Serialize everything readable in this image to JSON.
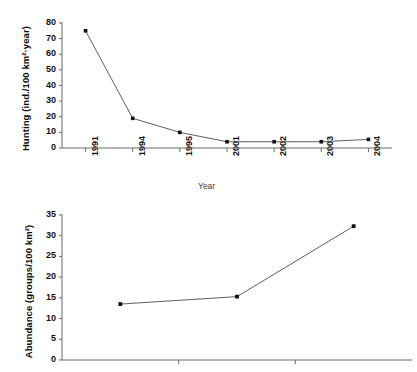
{
  "figure": {
    "background_color": "#ffffff",
    "line_color": "#4d4d4d",
    "marker_color": "#111111",
    "axis_color": "#6b6b6b"
  },
  "chart_data": [
    {
      "type": "line",
      "panel": "top",
      "title": "",
      "xlabel": "Year",
      "ylabel": "Hunting (ind./100 km²·year)",
      "categories": [
        "1991",
        "1994",
        "1995",
        "2001",
        "2002",
        "2003",
        "2004"
      ],
      "values": [
        75,
        19,
        10,
        4,
        4,
        4,
        5.5
      ],
      "ylim": [
        0,
        80
      ],
      "yticks": [
        0,
        10,
        20,
        30,
        40,
        50,
        60,
        70,
        80
      ],
      "ytick_labels": [
        "0",
        "10",
        "20",
        "30",
        "40",
        "50",
        "60",
        "70",
        "80"
      ],
      "xtick_labels": [
        "1991",
        "1994",
        "1995",
        "2001",
        "2002",
        "2003",
        "2004"
      ],
      "grid": false,
      "legend": null,
      "marker": "square"
    },
    {
      "type": "line",
      "panel": "bottom",
      "title": "",
      "xlabel": "",
      "ylabel": "Abundance (groups/100 km²)",
      "categories": [
        "",
        "",
        ""
      ],
      "values": [
        13.5,
        15.3,
        32.3
      ],
      "x_positions": [
        1,
        3,
        5
      ],
      "ylim": [
        0,
        35
      ],
      "yticks": [
        0,
        5,
        10,
        15,
        20,
        25,
        30,
        35
      ],
      "ytick_labels": [
        "0",
        "5",
        "10",
        "15",
        "20",
        "25",
        "30",
        "35"
      ],
      "xtick_labels": [
        "",
        "",
        ""
      ],
      "grid": false,
      "legend": null,
      "marker": "square"
    }
  ]
}
